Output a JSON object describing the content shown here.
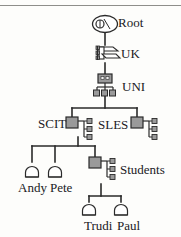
{
  "diagram": {
    "type": "tree",
    "colors": {
      "node_fill": "#9a9a9a",
      "node_stroke": "#2a2a2a",
      "line": "#2a2a2a",
      "text": "#20201e",
      "background": "#fdfdfb",
      "rule": "#8e8e8a"
    },
    "nodes": [
      {
        "id": "root",
        "label": "Root",
        "icon": "globe-icon",
        "level": 0,
        "x": 105,
        "y": 24
      },
      {
        "id": "uk",
        "label": "UK",
        "icon": "server-icon",
        "level": 1,
        "x": 105,
        "y": 54
      },
      {
        "id": "uni",
        "label": "UNI",
        "icon": "lan-icon",
        "level": 2,
        "x": 105,
        "y": 85
      },
      {
        "id": "scit",
        "label": "SCIT",
        "icon": "server-icon",
        "level": 3,
        "x": 72,
        "y": 122
      },
      {
        "id": "sles",
        "label": "SLES",
        "icon": "server-icon",
        "level": 3,
        "x": 134,
        "y": 122
      },
      {
        "id": "andy",
        "label": "Andy",
        "icon": "computer-icon",
        "level": 4,
        "x": 29,
        "y": 172
      },
      {
        "id": "pete",
        "label": "Pete",
        "icon": "computer-icon",
        "level": 4,
        "x": 56,
        "y": 172
      },
      {
        "id": "students",
        "label": "Students",
        "icon": "server-icon",
        "level": 4,
        "x": 95,
        "y": 168
      },
      {
        "id": "trudi",
        "label": "Trudi",
        "icon": "computer-icon",
        "level": 5,
        "x": 93,
        "y": 210
      },
      {
        "id": "paul",
        "label": "Paul",
        "icon": "computer-icon",
        "level": 5,
        "x": 125,
        "y": 210
      }
    ],
    "edges": [
      {
        "from": "root",
        "to": "uk"
      },
      {
        "from": "uk",
        "to": "uni"
      },
      {
        "from": "uni",
        "to": "scit"
      },
      {
        "from": "uni",
        "to": "sles"
      },
      {
        "from": "scit",
        "to": "andy"
      },
      {
        "from": "scit",
        "to": "pete"
      },
      {
        "from": "scit",
        "to": "students"
      },
      {
        "from": "students",
        "to": "trudi"
      },
      {
        "from": "students",
        "to": "paul"
      }
    ]
  }
}
